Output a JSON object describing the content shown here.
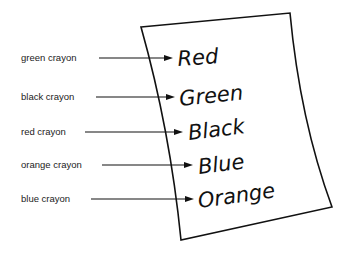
{
  "labels": [
    {
      "text": "green crayon",
      "word": "Red"
    },
    {
      "text": "black crayon",
      "word": "Green"
    },
    {
      "text": "red crayon",
      "word": "Black"
    },
    {
      "text": "orange crayon",
      "word": "Blue"
    },
    {
      "text": "blue crayon",
      "word": "Orange"
    }
  ],
  "colors": {
    "ink": "#111111",
    "background": "#ffffff"
  }
}
